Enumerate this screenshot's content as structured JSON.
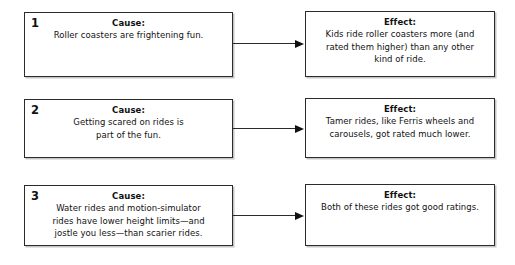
{
  "diagram": {
    "type": "cause-and-effect-chart",
    "arrow_icon": "arrow-right-icon",
    "colors": {
      "border": "#2b2b2b",
      "text": "#111111",
      "background": "#ffffff",
      "shadow": "#969696"
    },
    "rows": [
      {
        "number": "1",
        "cause": {
          "heading": "Cause:",
          "text": "Roller coasters are frightening fun."
        },
        "effect": {
          "heading": "Effect:",
          "text": "Kids ride roller coasters more (and\nrated them higher) than any other\nkind of ride."
        }
      },
      {
        "number": "2",
        "cause": {
          "heading": "Cause:",
          "text": "Getting scared on rides is\npart of the fun."
        },
        "effect": {
          "heading": "Effect:",
          "text": "Tamer rides, like Ferris wheels and\ncarousels, got rated much lower."
        }
      },
      {
        "number": "3",
        "cause": {
          "heading": "Cause:",
          "text": "Water rides and motion-simulator\nrides have lower height limits—and\njostle you less—than scarier rides."
        },
        "effect": {
          "heading": "Effect:",
          "text": "Both of these rides got good ratings."
        }
      }
    ]
  }
}
